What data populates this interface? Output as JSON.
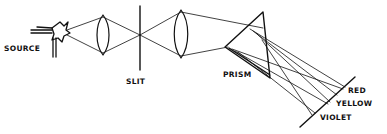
{
  "diagram": {
    "labels": {
      "source": "SOURCE",
      "slit": "SLIT",
      "prism": "PRISM",
      "red": "RED",
      "yellow": "YELLOW",
      "violet": "VIOLET"
    },
    "components": [
      "source",
      "condenser-lens",
      "slit",
      "collimator-lens",
      "prism",
      "screen"
    ],
    "colors": {
      "ink": "#111111",
      "background": "#ffffff"
    }
  }
}
